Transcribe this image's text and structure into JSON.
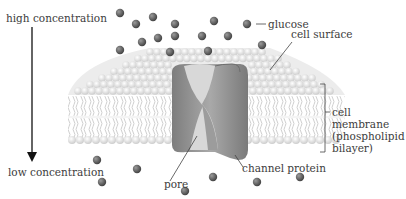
{
  "labels": {
    "high_concentration": "high concentration",
    "low_concentration": "low concentration",
    "glucose": "glucose",
    "cell_surface": "cell surface",
    "cell_membrane_line1": "cell",
    "cell_membrane_line2": "membrane",
    "cell_membrane_line3": "(phospholipid",
    "cell_membrane_line4": "bilayer)",
    "pore": "pore",
    "channel_protein": "channel protein"
  },
  "colors": {
    "glucose": "#5a5a5a",
    "phospholipid_head": "#e6e6e6",
    "tail": "#cfcfcf",
    "protein": "#8c8c8c",
    "pore_light": "#d6d6d6",
    "arrow": "#111111"
  },
  "glucose_above": [
    [
      120,
      13
    ],
    [
      136,
      24
    ],
    [
      153,
      17
    ],
    [
      175,
      24
    ],
    [
      214,
      21
    ],
    [
      247,
      24
    ],
    [
      142,
      42
    ],
    [
      158,
      38
    ],
    [
      175,
      36
    ],
    [
      202,
      36
    ],
    [
      228,
      36
    ],
    [
      120,
      50
    ],
    [
      170,
      52
    ],
    [
      208,
      51
    ],
    [
      262,
      45
    ]
  ],
  "glucose_below": [
    [
      97,
      160
    ],
    [
      137,
      169
    ],
    [
      102,
      182
    ],
    [
      213,
      177
    ],
    [
      257,
      182
    ],
    [
      300,
      177
    ],
    [
      185,
      191
    ]
  ]
}
